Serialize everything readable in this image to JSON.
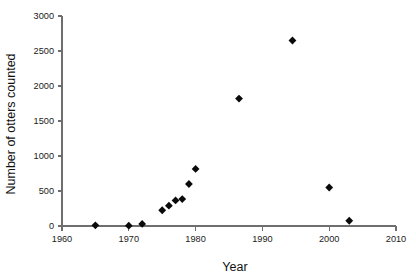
{
  "chart_data": {
    "type": "scatter",
    "title": "",
    "xlabel": "Year",
    "ylabel": "Number of otters counted",
    "xlim": [
      1960,
      2010
    ],
    "ylim": [
      0,
      3000
    ],
    "xticks": [
      1960,
      1970,
      1980,
      1990,
      2000,
      2010
    ],
    "xtick_labels": [
      "1960",
      "1970",
      "1980",
      "1990",
      "2000",
      "2010"
    ],
    "yticks": [
      0,
      500,
      1000,
      1500,
      2000,
      2500,
      3000
    ],
    "ytick_labels": [
      "0",
      "500",
      "1000",
      "1500",
      "2000",
      "2500",
      "3000"
    ],
    "grid": false,
    "legend": false,
    "marker": "diamond",
    "marker_color": "#0a0a0a",
    "axis_color": "#6e6e6e",
    "series": [
      {
        "name": "Otters counted",
        "x": [
          1965,
          1970,
          1972,
          1975,
          1976,
          1977,
          1978,
          1979,
          1980,
          1986.5,
          1994.5,
          2000,
          2003
        ],
        "y": [
          10,
          5,
          30,
          225,
          290,
          365,
          385,
          600,
          815,
          1820,
          2650,
          550,
          75
        ]
      }
    ]
  },
  "axes": {
    "x_title": "Year",
    "y_title": "Number of otters counted"
  }
}
